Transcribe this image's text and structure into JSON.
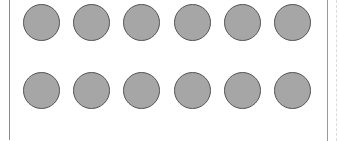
{
  "diagram": {
    "type": "dot-array",
    "rows": 2,
    "columns": 6,
    "total_dots": 12,
    "dot_fill": "#a6a6a6",
    "dot_stroke": "#555555",
    "frame_color": "#8a8a8a",
    "dots": [
      {
        "row": 0,
        "col": 0,
        "x": 23,
        "y": 4
      },
      {
        "row": 0,
        "col": 1,
        "x": 73,
        "y": 4
      },
      {
        "row": 0,
        "col": 2,
        "x": 123,
        "y": 4
      },
      {
        "row": 0,
        "col": 3,
        "x": 174,
        "y": 4
      },
      {
        "row": 0,
        "col": 4,
        "x": 224,
        "y": 4
      },
      {
        "row": 0,
        "col": 5,
        "x": 274,
        "y": 4
      },
      {
        "row": 1,
        "col": 0,
        "x": 23,
        "y": 72
      },
      {
        "row": 1,
        "col": 1,
        "x": 73,
        "y": 72
      },
      {
        "row": 1,
        "col": 2,
        "x": 123,
        "y": 72
      },
      {
        "row": 1,
        "col": 3,
        "x": 174,
        "y": 72
      },
      {
        "row": 1,
        "col": 4,
        "x": 224,
        "y": 72
      },
      {
        "row": 1,
        "col": 5,
        "x": 274,
        "y": 72
      }
    ]
  }
}
